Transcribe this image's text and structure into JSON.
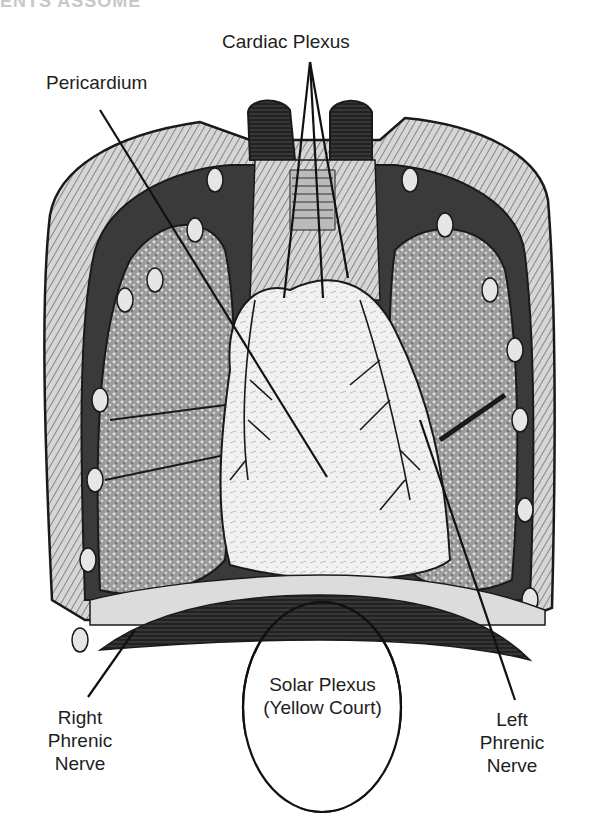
{
  "page": {
    "clipped_header": "ENTS ASSOME"
  },
  "diagram": {
    "labels": {
      "cardiac_plexus": "Cardiac Plexus",
      "pericardium": "Pericardium",
      "solar_plexus_line1": "Solar Plexus",
      "solar_plexus_line2": "(Yellow Court)",
      "right_phrenic_line1": "Right",
      "right_phrenic_line2": "Phrenic",
      "right_phrenic_line3": "Nerve",
      "left_phrenic_line1": "Left",
      "left_phrenic_line2": "Phrenic",
      "left_phrenic_line3": "Nerve"
    },
    "colors": {
      "ink": "#1a1a1a",
      "dark_tissue": "#2a2a2a",
      "mid_tissue": "#6a6a6a",
      "light_tissue": "#bdbdbd",
      "heart": "#e9e9e9",
      "background": "#ffffff"
    }
  }
}
